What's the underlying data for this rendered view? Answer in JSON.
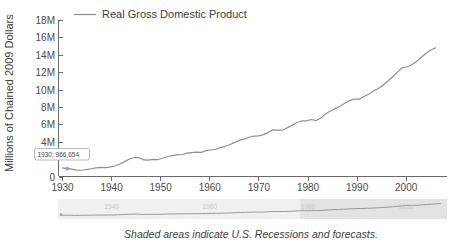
{
  "chart_data": {
    "type": "line",
    "title": "",
    "xlabel": "",
    "ylabel": "Millions of Chained 2009 Dollars",
    "xlim": [
      1929,
      2008
    ],
    "ylim": [
      0,
      18000000
    ],
    "grid": false,
    "legend_position": "top",
    "y_tick_labels": [
      "0",
      "4M",
      "6M",
      "8M",
      "10M",
      "12M",
      "14M",
      "16M",
      "18M"
    ],
    "y_ticks": [
      0,
      4000000,
      6000000,
      8000000,
      10000000,
      12000000,
      14000000,
      16000000,
      18000000
    ],
    "x_tick_labels": [
      "1930",
      "1940",
      "1950",
      "1960",
      "1970",
      "1980",
      "1990",
      "2000"
    ],
    "x_ticks": [
      1930,
      1940,
      1950,
      1960,
      1970,
      1980,
      1990,
      2000
    ],
    "series": [
      {
        "name": "Real Gross Domestic Product",
        "color": "#8f8f8f",
        "x": [
          1929,
          1930,
          1931,
          1932,
          1933,
          1934,
          1935,
          1936,
          1937,
          1938,
          1939,
          1940,
          1941,
          1942,
          1943,
          1944,
          1945,
          1946,
          1947,
          1948,
          1949,
          1950,
          1951,
          1952,
          1953,
          1954,
          1955,
          1956,
          1957,
          1958,
          1959,
          1960,
          1961,
          1962,
          1963,
          1964,
          1965,
          1966,
          1967,
          1968,
          1969,
          1970,
          1971,
          1972,
          1973,
          1974,
          1975,
          1976,
          1977,
          1978,
          1979,
          1980,
          1981,
          1982,
          1983,
          1984,
          1985,
          1986,
          1987,
          1988,
          1989,
          1990,
          1991,
          1992,
          1993,
          1994,
          1995,
          1996,
          1997,
          1998,
          1999,
          2000,
          2001,
          2002,
          2003,
          2004,
          2005,
          2006,
          2007
        ],
        "y": [
          1056600,
          966654,
          904800,
          788200,
          778300,
          862200,
          939000,
          1060600,
          1114600,
          1076700,
          1163600,
          1266100,
          1490300,
          1771800,
          2073700,
          2239400,
          2217800,
          1960900,
          1939400,
          2020000,
          2008900,
          2184000,
          2360000,
          2456100,
          2571700,
          2556500,
          2739000,
          2797400,
          2856300,
          2835300,
          3031000,
          3108700,
          3188100,
          3383100,
          3530400,
          3734000,
          3976700,
          4238900,
          4355200,
          4569000,
          4712500,
          4722000,
          4877600,
          5134300,
          5424100,
          5396000,
          5385400,
          5675400,
          5937000,
          6267200,
          6466200,
          6450400,
          6617700,
          6491300,
          6792000,
          7285000,
          7593800,
          7860500,
          8132600,
          8474500,
          8786400,
          8955000,
          8948400,
          9266600,
          9521000,
          9905400,
          10174800,
          10561000,
          11034900,
          11525900,
          12065900,
          12559700,
          12682200,
          12908800,
          13271100,
          13773500,
          14234200,
          14613800,
          14873700
        ]
      }
    ],
    "annotation": {
      "label": "1930: 966,654",
      "x": 1930,
      "y": 966654
    },
    "caption": "Shaded areas indicate U.S. Recessions and forecasts.",
    "navigator": {
      "tick_labels": [
        "1940",
        "1960",
        "1980",
        "2000"
      ],
      "ticks": [
        1940,
        1960,
        1980,
        2000
      ]
    }
  },
  "legend": {
    "items": [
      {
        "label": "Real Gross Domestic Product",
        "color": "#8f8f8f"
      }
    ]
  },
  "axes": {
    "y_title": "Millions of Chained 2009 Dollars"
  },
  "footer": {
    "caption": "Shaded areas indicate U.S. Recessions and forecasts."
  },
  "tooltip": {
    "text": "1930: 966,654"
  }
}
